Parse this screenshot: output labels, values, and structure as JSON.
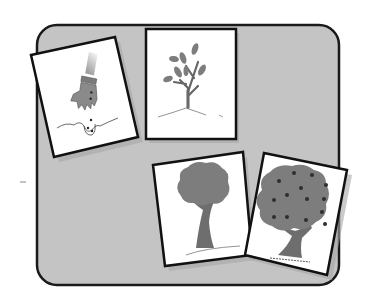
{
  "scene": {
    "title": "Apple tree life cycle sequence cards",
    "background_color": "#ffffff",
    "board": {
      "fill": "#c4c4c4",
      "stroke": "#1a1a1a",
      "x": 37,
      "y": 25,
      "width": 302,
      "height": 260,
      "radius": 20
    },
    "cards": [
      {
        "id": "card-planting-seed",
        "label": "Hand planting seeds in soil",
        "order": 1,
        "points": "31,55 115,37 138,137 54,157"
      },
      {
        "id": "card-sapling",
        "label": "Young sapling with leaves",
        "order": 2,
        "points": "146,29 236,29 236,139 146,139"
      },
      {
        "id": "card-grown-tree",
        "label": "Grown tree",
        "order": 3,
        "points": "153,165 243,152 252,255 165,266"
      },
      {
        "id": "card-fruit-tree",
        "label": "Tree bearing fruit",
        "order": 4,
        "points": "264,153 347,170 327,275 245,255"
      }
    ],
    "colors": {
      "card_fill": "#ffffff",
      "card_stroke": "#111111",
      "foliage": "#7d7d7d",
      "trunk": "#6e6e6e",
      "fruit": "#2e2e2e",
      "glove": "#8a8a8a",
      "shadow": "#a6a6a6"
    },
    "stray_mark": {
      "x": 20,
      "y": 182,
      "width": 6
    }
  }
}
